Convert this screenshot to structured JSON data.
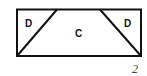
{
  "diagram": {
    "regions": [
      {
        "label": "D",
        "position": "left-triangle"
      },
      {
        "label": "C",
        "position": "center-trapezoid"
      },
      {
        "label": "D",
        "position": "right-triangle"
      }
    ],
    "figure_number": "2"
  }
}
